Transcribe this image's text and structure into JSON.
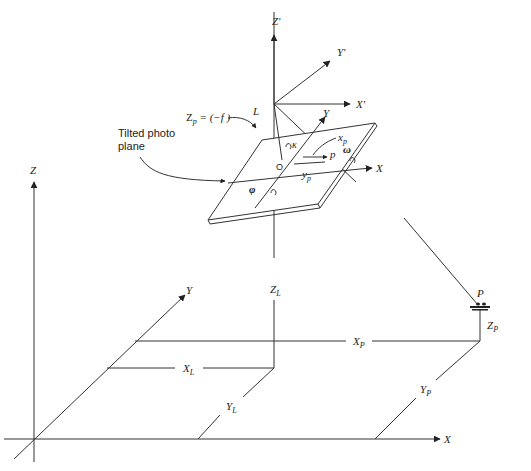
{
  "figure": {
    "labels": {
      "ground_z": "Z",
      "ground_y": "Y",
      "ground_x": "X",
      "image_z_prime": "Z'",
      "image_y_prime": "Y'",
      "image_x_prime": "X'",
      "photo_y": "Y",
      "photo_x": "X",
      "exposure_station": "L",
      "focal": "Zp = (-f)",
      "focal_main": "Z",
      "focal_sub": "p",
      "focal_rest": " = (−f )",
      "tilted_plane_line1": "Tilted photo",
      "tilted_plane_line2": "plane",
      "origin": "O",
      "kappa": "κ",
      "phi": "φ",
      "omega": "ω",
      "image_point": "p",
      "xp_main": "x",
      "xp_sub": "p",
      "yp_main": "y",
      "yp_sub": "p",
      "ground_point": "P",
      "ZL_main": "Z",
      "ZL_sub": "L",
      "XL_main": "X",
      "XL_sub": "L",
      "YL_main": "Y",
      "YL_sub": "L",
      "XP_main": "X",
      "XP_sub": "P",
      "YP_main": "Y",
      "YP_sub": "P",
      "ZP_main": "Z",
      "ZP_sub": "P"
    }
  }
}
